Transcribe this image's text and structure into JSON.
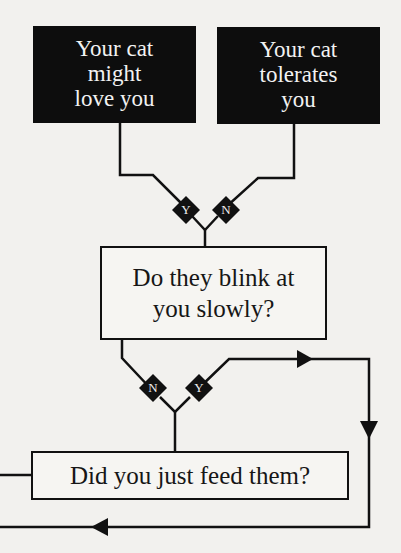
{
  "diagram": {
    "type": "flowchart",
    "nodes": {
      "love": {
        "lines": [
          "Your cat",
          "might",
          "love you"
        ],
        "style": "dark-terminal"
      },
      "tolerates": {
        "lines": [
          "Your cat",
          "tolerates",
          "you"
        ],
        "style": "dark-terminal"
      },
      "blink": {
        "lines": [
          "Do they blink at",
          "you slowly?"
        ],
        "style": "decision"
      },
      "feed": {
        "lines": [
          "Did you just feed them?"
        ],
        "style": "decision"
      }
    },
    "branches": {
      "blink_yes": "Y",
      "blink_no": "N",
      "feed_no": "N",
      "feed_yes": "Y"
    },
    "edges": [
      {
        "from": "blink",
        "label": "Y",
        "to": "love"
      },
      {
        "from": "blink",
        "label": "N",
        "to": "tolerates"
      },
      {
        "from": "feed",
        "label": "N",
        "to": "blink"
      },
      {
        "from": "feed",
        "label": "Y",
        "to": "loop-right-then-back-left"
      }
    ],
    "colors": {
      "background": "#f2f1ee",
      "ink": "#111111",
      "dark_box": "#0d0d0d",
      "dark_box_text": "#f2f2f2"
    }
  }
}
